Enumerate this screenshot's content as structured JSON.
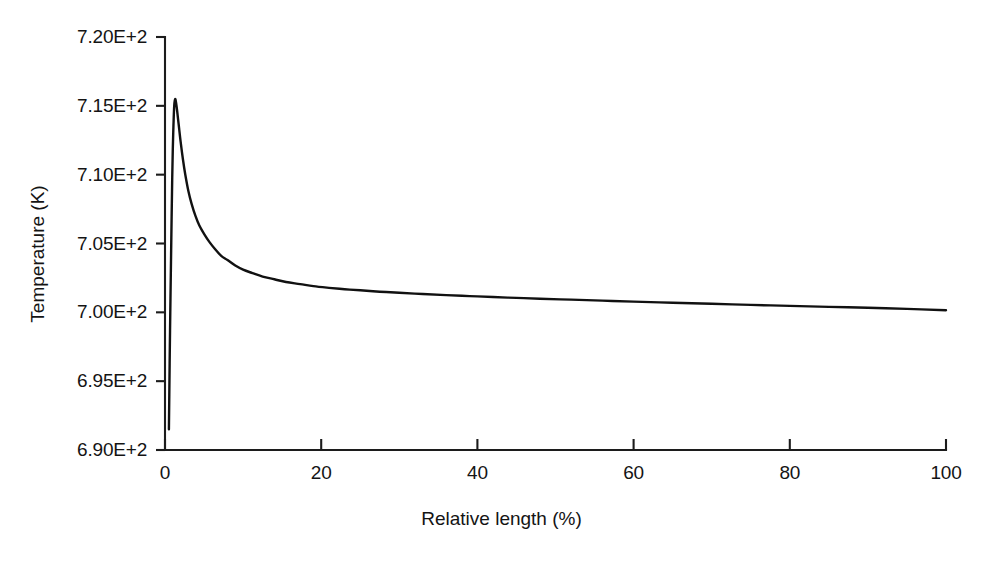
{
  "chart_data": {
    "type": "line",
    "title": "",
    "xlabel": "Relative length (%)",
    "ylabel": "Temperature (K)",
    "xlim": [
      0,
      100
    ],
    "ylim": [
      690,
      720
    ],
    "xticks": [
      "0",
      "20",
      "40",
      "60",
      "80",
      "100"
    ],
    "xtick_values": [
      0,
      20,
      40,
      60,
      80,
      100
    ],
    "yticks": [
      "6.90E+2",
      "6.95E+2",
      "7.00E+2",
      "7.05E+2",
      "7.10E+2",
      "7.15E+2",
      "7.20E+2"
    ],
    "ytick_values": [
      690,
      695,
      700,
      705,
      710,
      715,
      720
    ],
    "grid": false,
    "legend": false,
    "legend_position": "none",
    "line_color": "#111111",
    "series": [
      {
        "name": "Temperature profile",
        "x": [
          0.5,
          0.55,
          0.62,
          0.7,
          0.78,
          0.85,
          0.92,
          1.0,
          1.08,
          1.18,
          1.3,
          1.45,
          1.6,
          1.8,
          2.0,
          2.3,
          2.6,
          3.0,
          3.4,
          3.9,
          4.4,
          5.0,
          5.7,
          6.4,
          7.2,
          8.0,
          9.0,
          10.0,
          11.2,
          12.5,
          14.0,
          15.5,
          17.3,
          19.0,
          21.0,
          23.0,
          25.0,
          27.5,
          30.0,
          33.0,
          36.0,
          39.0,
          42.0,
          45.0,
          48.0,
          52.0,
          56.0,
          60.0,
          65.0,
          70.0,
          75.0,
          80.0,
          85.0,
          90.0,
          95.0,
          100.0
        ],
        "y": [
          691.5,
          694.0,
          697.5,
          701.0,
          704.2,
          707.0,
          709.6,
          711.9,
          713.5,
          715.0,
          715.5,
          715.1,
          714.4,
          713.4,
          712.4,
          711.1,
          710.0,
          708.8,
          707.9,
          707.0,
          706.3,
          705.7,
          705.1,
          704.6,
          704.1,
          703.8,
          703.4,
          703.1,
          702.85,
          702.6,
          702.4,
          702.2,
          702.05,
          701.9,
          701.78,
          701.68,
          701.6,
          701.5,
          701.42,
          701.33,
          701.25,
          701.18,
          701.11,
          701.05,
          700.99,
          700.92,
          700.85,
          700.78,
          700.7,
          700.62,
          700.54,
          700.47,
          700.4,
          700.33,
          700.25,
          700.15
        ]
      }
    ]
  },
  "axis": {
    "x_title": "Relative length (%)",
    "y_title": "Temperature (K)"
  }
}
